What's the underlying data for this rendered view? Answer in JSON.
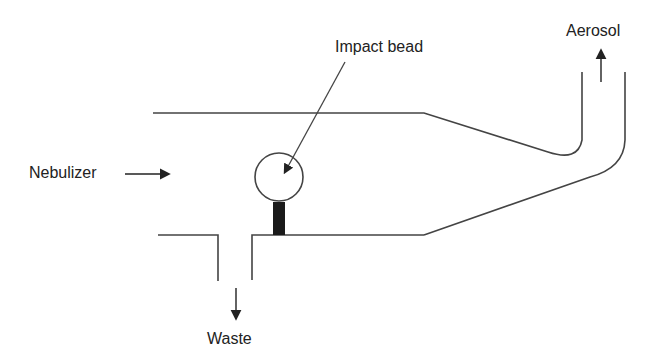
{
  "diagram": {
    "title": "",
    "labels": {
      "nebulizer": "Nebulizer",
      "impact_bead": "Impact bead",
      "aerosol": "Aerosol",
      "waste": "Waste"
    },
    "colors": {
      "line": "#444444",
      "stem": "#1a1a1a",
      "background": "#ffffff"
    }
  }
}
